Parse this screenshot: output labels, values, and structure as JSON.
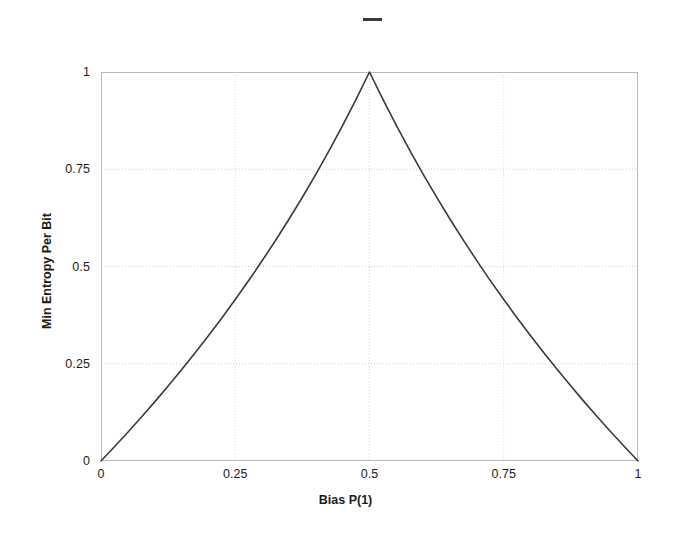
{
  "figure": {
    "background_color": "#ffffff",
    "line_color": "#3a3a3a",
    "grid_color": "#cccccc",
    "frame_color": "#b9b9b9"
  },
  "legend": {
    "entries": [
      {
        "label": "",
        "swatch_name": "line-swatch",
        "color": "#3a3a3a"
      }
    ]
  },
  "axes": {
    "y_title": "Min Entropy Per Bit",
    "x_title": "Bias P(1)",
    "y_ticks": [
      "1",
      "0.75",
      "0.5",
      "0.25",
      "0"
    ],
    "x_ticks": [
      "0",
      "0.25",
      "0.5",
      "0.75",
      "1"
    ]
  },
  "chart_data": {
    "type": "line",
    "title": "",
    "xlabel": "Bias P(1)",
    "ylabel": "Min Entropy Per Bit",
    "xlim": [
      0,
      1
    ],
    "ylim": [
      0,
      1
    ],
    "xticks": [
      0,
      0.25,
      0.5,
      0.75,
      1
    ],
    "yticks": [
      0,
      0.25,
      0.5,
      0.75,
      1
    ],
    "xticklabels": [
      "0",
      "0.25",
      "0.5",
      "0.75",
      "1"
    ],
    "yticklabels": [
      "0",
      "0.25",
      "0.5",
      "0.75",
      "1"
    ],
    "grid": true,
    "legend_position": "top-center",
    "series": [
      {
        "name": "",
        "color": "#3a3a3a",
        "linewidth": 1.6,
        "formula": "H_inf(p) = -log2(max(p, 1-p))",
        "x": [
          0,
          0.025,
          0.05,
          0.075,
          0.1,
          0.125,
          0.15,
          0.175,
          0.2,
          0.225,
          0.25,
          0.275,
          0.3,
          0.325,
          0.35,
          0.375,
          0.4,
          0.425,
          0.45,
          0.475,
          0.5,
          0.525,
          0.55,
          0.575,
          0.6,
          0.625,
          0.65,
          0.675,
          0.7,
          0.725,
          0.75,
          0.775,
          0.8,
          0.825,
          0.85,
          0.875,
          0.9,
          0.925,
          0.95,
          0.975,
          1
        ],
        "y": [
          0,
          0.0366,
          0.074,
          0.1125,
          0.152,
          0.1926,
          0.2345,
          0.2776,
          0.3219,
          0.3677,
          0.415,
          0.4638,
          0.5146,
          0.567,
          0.6215,
          0.6781,
          0.737,
          0.7984,
          0.8625,
          0.9297,
          1.0,
          0.9297,
          0.8625,
          0.7984,
          0.737,
          0.6781,
          0.6215,
          0.567,
          0.5146,
          0.4638,
          0.415,
          0.3677,
          0.3219,
          0.2776,
          0.2345,
          0.1926,
          0.152,
          0.1125,
          0.074,
          0.0366,
          0
        ]
      }
    ],
    "annotations": [
      {
        "text": "peak at p = 0.5, value 1",
        "x": 0.5,
        "y": 1
      }
    ]
  }
}
